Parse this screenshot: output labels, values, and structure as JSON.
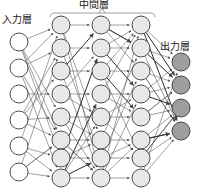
{
  "diagram": {
    "labels": {
      "input_layer": "入力層",
      "hidden_layer": "中間層",
      "output_layer": "出力層"
    },
    "colors": {
      "input_node_fill": "#ffffff",
      "hidden_node_fill": "#e8e8e8",
      "output_node_fill": "#9e9e9e",
      "node_stroke": "#3a3a3a",
      "edge_color": "#555555",
      "brace_color": "#888888",
      "background": "#ffffff",
      "text_color": "#1a1a1a"
    },
    "layers": [
      {
        "name": "input",
        "label": "入力層",
        "node_count": 6,
        "x": 19,
        "radius": 9,
        "y_positions": [
          42,
          68,
          94,
          120,
          146,
          172
        ],
        "fill": "#ffffff"
      },
      {
        "name": "hidden-1",
        "label": "中間層",
        "node_count": 8,
        "x": 61,
        "radius": 9,
        "y_positions": [
          25,
          48,
          71,
          94,
          117,
          140,
          158,
          178
        ],
        "fill": "#e8e8e8"
      },
      {
        "name": "hidden-2",
        "label": "中間層",
        "node_count": 8,
        "x": 101,
        "radius": 9,
        "y_positions": [
          25,
          48,
          71,
          94,
          117,
          140,
          158,
          178
        ],
        "fill": "#e8e8e8"
      },
      {
        "name": "hidden-3",
        "label": "中間層",
        "node_count": 8,
        "x": 141,
        "radius": 9,
        "y_positions": [
          25,
          48,
          71,
          94,
          117,
          140,
          158,
          178
        ],
        "fill": "#e8e8e8"
      },
      {
        "name": "output",
        "label": "出力層",
        "node_count": 4,
        "x": 181,
        "radius": 9,
        "y_positions": [
          62,
          85,
          108,
          131
        ],
        "fill": "#9e9e9e"
      }
    ],
    "brace": {
      "left_x": 50,
      "right_x": 155,
      "y": 13,
      "tick_x": 102,
      "tick_height": 5
    }
  }
}
